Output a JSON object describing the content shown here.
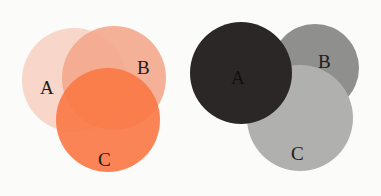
{
  "diagrams": [
    {
      "name": "color-venn",
      "circles": [
        {
          "label": "A",
          "color": "#f7cfc0",
          "opacity": 0.85
        },
        {
          "label": "B",
          "color": "#f3a587",
          "opacity": 0.85
        },
        {
          "label": "C",
          "color": "#f9743f",
          "opacity": 0.85
        }
      ]
    },
    {
      "name": "grayscale-venn",
      "circles": [
        {
          "label": "A",
          "color": "#2b2727"
        },
        {
          "label": "B",
          "color": "#8f8f8d"
        },
        {
          "label": "C",
          "color": "#afafad"
        }
      ]
    }
  ]
}
